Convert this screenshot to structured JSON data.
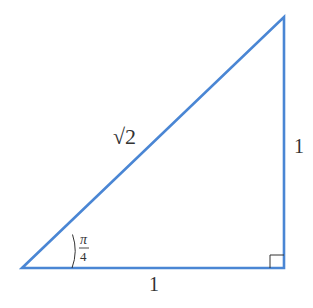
{
  "diagram": {
    "type": "right-triangle",
    "stroke_color": "#4a86d4",
    "label_color": "#333333",
    "vertices": {
      "bottom_left": [
        22,
        268
      ],
      "bottom_right": [
        284,
        268
      ],
      "top_right": [
        284,
        17
      ]
    },
    "labels": {
      "hypotenuse": "√2",
      "vertical_side": "1",
      "horizontal_side": "1",
      "angle_numerator": "π",
      "angle_denominator": "4"
    },
    "right_angle_marker": true
  }
}
